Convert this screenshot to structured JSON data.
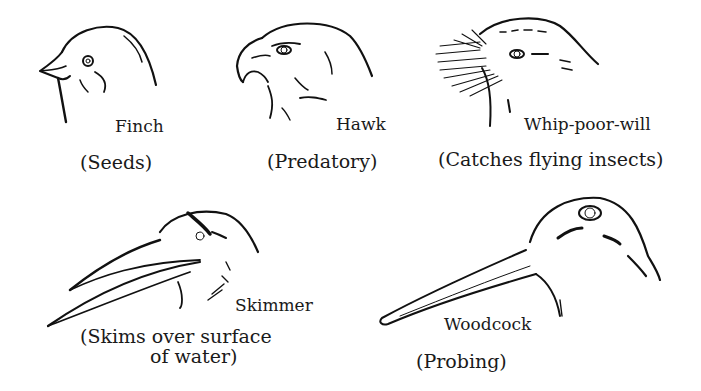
{
  "diagram": {
    "birds": [
      {
        "id": "finch",
        "name": "Finch",
        "diet": "(Seeds)"
      },
      {
        "id": "hawk",
        "name": "Hawk",
        "diet": "(Predatory)"
      },
      {
        "id": "whip-poor-will",
        "name": "Whip-poor-will",
        "diet": "(Catches flying insects)"
      },
      {
        "id": "skimmer",
        "name": "Skimmer",
        "diet_line1": "(Skims over surface",
        "diet_line2": "of water)"
      },
      {
        "id": "woodcock",
        "name": "Woodcock",
        "diet": "(Probing)"
      }
    ]
  }
}
